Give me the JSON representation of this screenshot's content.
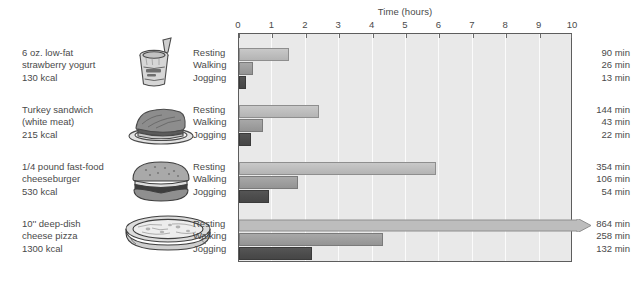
{
  "chart_data": {
    "type": "bar",
    "title": "Time (hours)",
    "xlabel": "Time (hours)",
    "ylabel": "",
    "xlim": [
      0,
      10
    ],
    "x_ticks": [
      "0",
      "1",
      "2",
      "3",
      "4",
      "5",
      "6",
      "7",
      "8",
      "9",
      "10"
    ],
    "grid": true,
    "orientation": "horizontal",
    "legend_position": "none",
    "activity_labels": [
      "Resting",
      "Walking",
      "Jogging"
    ],
    "groups": [
      {
        "food_name_lines": [
          "6 oz. low-fat",
          "strawberry yogurt",
          "130 kcal"
        ],
        "icon": "yogurt-cup-icon",
        "values_min": [
          90,
          26,
          13
        ],
        "values_hours": [
          1.5,
          0.433,
          0.217
        ],
        "labels_min": [
          "90 min",
          "26 min",
          "13 min"
        ],
        "overflow": [
          false,
          false,
          false
        ]
      },
      {
        "food_name_lines": [
          "Turkey sandwich",
          "(white meat)",
          "215 kcal"
        ],
        "icon": "sandwich-icon",
        "values_min": [
          144,
          43,
          22
        ],
        "values_hours": [
          2.4,
          0.717,
          0.367
        ],
        "labels_min": [
          "144 min",
          "43 min",
          "22 min"
        ],
        "overflow": [
          false,
          false,
          false
        ]
      },
      {
        "food_name_lines": [
          "1/4 pound fast-food",
          "cheeseburger",
          "530 kcal"
        ],
        "icon": "cheeseburger-icon",
        "values_min": [
          354,
          106,
          54
        ],
        "values_hours": [
          5.9,
          1.767,
          0.9
        ],
        "labels_min": [
          "354 min",
          "106 min",
          "54 min"
        ],
        "overflow": [
          false,
          false,
          false
        ]
      },
      {
        "food_name_lines": [
          "10'' deep-dish",
          "cheese pizza",
          "1300 kcal"
        ],
        "icon": "pizza-icon",
        "values_min": [
          864,
          258,
          132
        ],
        "values_hours": [
          14.4,
          4.3,
          2.2
        ],
        "labels_min": [
          "864 min",
          "258 min",
          "132 min"
        ],
        "overflow": [
          true,
          false,
          false
        ]
      }
    ],
    "colors": {
      "resting": "#bdbdbd",
      "walking": "#9d9d9d",
      "jogging": "#4c4c4c",
      "plot_background": "#e9e9e9",
      "gridline": "#fbfbfb",
      "border": "#5d5d5d",
      "text": "#4a4a4a"
    }
  }
}
